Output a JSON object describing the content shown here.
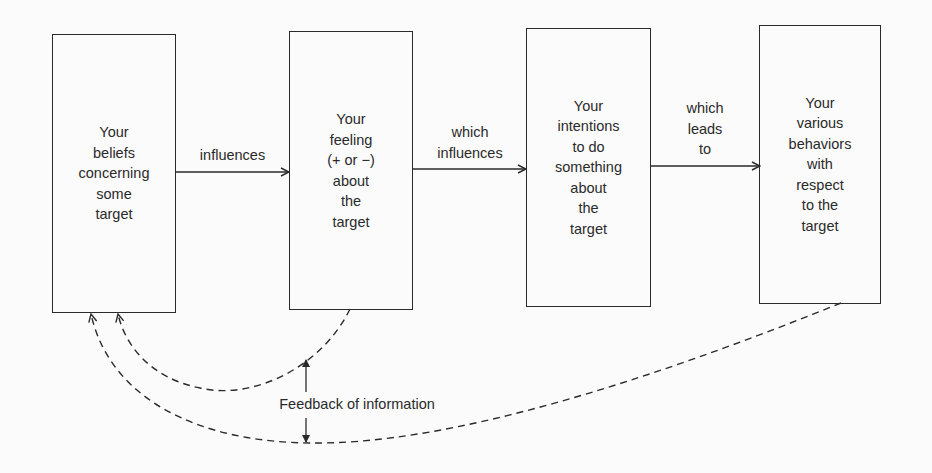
{
  "diagram": {
    "boxes": [
      {
        "id": "beliefs",
        "text": "Your\nbeliefs\nconcerning\nsome\ntarget"
      },
      {
        "id": "feeling",
        "text": "Your\nfeeling\n(+ or −)\nabout\nthe\ntarget"
      },
      {
        "id": "intentions",
        "text": "Your\nintentions\nto do\nsomething\nabout\nthe\ntarget"
      },
      {
        "id": "behaviors",
        "text": "Your\nvarious\nbehaviors\nwith\nrespect\nto the\ntarget"
      }
    ],
    "edges": [
      {
        "from": "beliefs",
        "to": "feeling",
        "label": "influences"
      },
      {
        "from": "feeling",
        "to": "intentions",
        "label": "which\ninfluences"
      },
      {
        "from": "intentions",
        "to": "behaviors",
        "label": "which\nleads\nto"
      }
    ],
    "feedback": {
      "label": "Feedback of information",
      "edges": [
        {
          "from": "feeling",
          "to": "beliefs",
          "style": "dashed"
        },
        {
          "from": "behaviors",
          "to": "beliefs",
          "style": "dashed"
        }
      ]
    }
  }
}
